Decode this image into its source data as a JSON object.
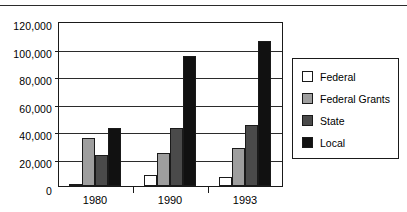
{
  "chart_data": {
    "type": "bar",
    "title": "",
    "subtitle": "",
    "xlabel": "",
    "ylabel": "",
    "categories": [
      "1980",
      "1990",
      "1993"
    ],
    "series": [
      {
        "name": "Federal",
        "color": "#ffffff",
        "values": [
          1500,
          8000,
          7000
        ]
      },
      {
        "name": "Federal Grants",
        "color": "#9e9e9e",
        "values": [
          35000,
          24000,
          28000
        ]
      },
      {
        "name": "State",
        "color": "#4a4a4a",
        "values": [
          22500,
          42500,
          45000
        ]
      },
      {
        "name": "Local",
        "color": "#111111",
        "values": [
          43000,
          95500,
          107000
        ]
      }
    ],
    "ylim": [
      0,
      120000
    ],
    "ytick_values": [
      0,
      20000,
      40000,
      60000,
      80000,
      100000,
      120000
    ],
    "ytick_labels": [
      "0",
      "20,000",
      "40,000",
      "60,000",
      "80,000",
      "100,000",
      "120,000"
    ],
    "grid": true,
    "grid_axis": "y",
    "legend_position": "right",
    "legend_entries": [
      "Federal",
      "Federal Grants",
      "State",
      "Local"
    ]
  },
  "decorations": {
    "top_rule": true
  }
}
